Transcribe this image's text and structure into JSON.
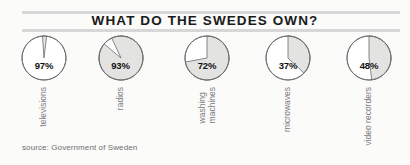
{
  "header": {
    "title": "WHAT DO THE SWEDES OWN?"
  },
  "footer": {
    "source": "source: Government of Sweden"
  },
  "colors": {
    "background": "#fbfbfa",
    "rule": "#d7d7d7",
    "pie_fill": "#e3e3e1",
    "pie_empty": "#ffffff",
    "pie_stroke": "#6b6b6b",
    "title_text": "#1a1a1a",
    "label_text": "#7c7c7c",
    "percent_text": "#111111"
  },
  "chart_data": {
    "type": "pie",
    "title": "WHAT DO THE SWEDES OWN?",
    "xlabel": "",
    "ylabel": "",
    "unit": "%",
    "note": "Five separate single-value pie charts; shaded wedge = share of households owning the item, measured clockwise from 12 o'clock.",
    "categories": [
      "televisions",
      "radios",
      "washing machines",
      "microwaves",
      "video recorders"
    ],
    "values": [
      97,
      93,
      72,
      37,
      48
    ],
    "series": [
      {
        "name": "ownership",
        "values": [
          97,
          93,
          72,
          37,
          48
        ]
      }
    ],
    "slices": [
      {
        "label": "televisions",
        "value": 97,
        "display": "97%",
        "label_lines": [
          "televisions"
        ],
        "shaded_share": 3,
        "shaded_is_remainder": true,
        "sweep_deg": 10.8,
        "start_deg": -4
      },
      {
        "label": "radios",
        "value": 93,
        "display": "93%",
        "label_lines": [
          "radios"
        ],
        "shaded_share": 93,
        "shaded_is_remainder": false,
        "sweep_deg": 334.8,
        "start_deg": -25
      },
      {
        "label": "washing machines",
        "value": 72,
        "display": "72%",
        "label_lines": [
          "washing",
          "machines"
        ],
        "shaded_share": 72,
        "shaded_is_remainder": false,
        "sweep_deg": 259.2,
        "start_deg": 0
      },
      {
        "label": "microwaves",
        "value": 37,
        "display": "37%",
        "label_lines": [
          "microwaves"
        ],
        "shaded_share": 37,
        "shaded_is_remainder": false,
        "sweep_deg": 133.2,
        "start_deg": 0
      },
      {
        "label": "video recorders",
        "value": 48,
        "display": "48%",
        "label_lines": [
          "video recorders"
        ],
        "shaded_share": 48,
        "shaded_is_remainder": false,
        "sweep_deg": 172.8,
        "start_deg": 0
      }
    ]
  }
}
